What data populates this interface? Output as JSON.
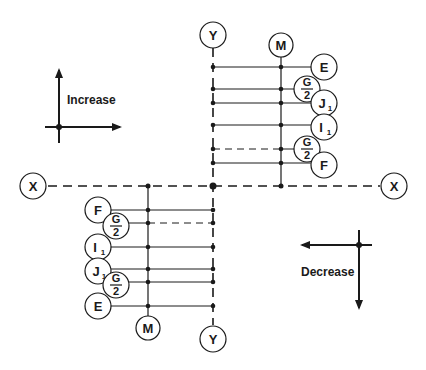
{
  "diagram": {
    "axes": {
      "x_label": "X",
      "y_label": "Y",
      "origin": {
        "x": 213,
        "y": 186
      }
    },
    "legend_increase": {
      "label": "Increase"
    },
    "legend_decrease": {
      "label": "Decrease"
    },
    "upper_right_group": {
      "member_label": "M",
      "rows": [
        {
          "label": "E",
          "sub": "",
          "dashed": false
        },
        {
          "label": "G/2",
          "sub": "",
          "dashed": false
        },
        {
          "label": "J",
          "sub": "1",
          "dashed": false
        },
        {
          "label": "I",
          "sub": "1",
          "dashed": false
        },
        {
          "label": "G/2",
          "sub": "",
          "dashed": true
        },
        {
          "label": "F",
          "sub": "",
          "dashed": false
        }
      ]
    },
    "lower_left_group": {
      "member_label": "M",
      "rows": [
        {
          "label": "F",
          "sub": "",
          "dashed": false
        },
        {
          "label": "G/2",
          "sub": "",
          "dashed": true
        },
        {
          "label": "I",
          "sub": "1",
          "dashed": false
        },
        {
          "label": "J",
          "sub": "1",
          "dashed": false
        },
        {
          "label": "G/2",
          "sub": "",
          "dashed": false
        },
        {
          "label": "E",
          "sub": "",
          "dashed": false
        }
      ]
    },
    "fraction": {
      "num": "G",
      "den": "2"
    }
  }
}
